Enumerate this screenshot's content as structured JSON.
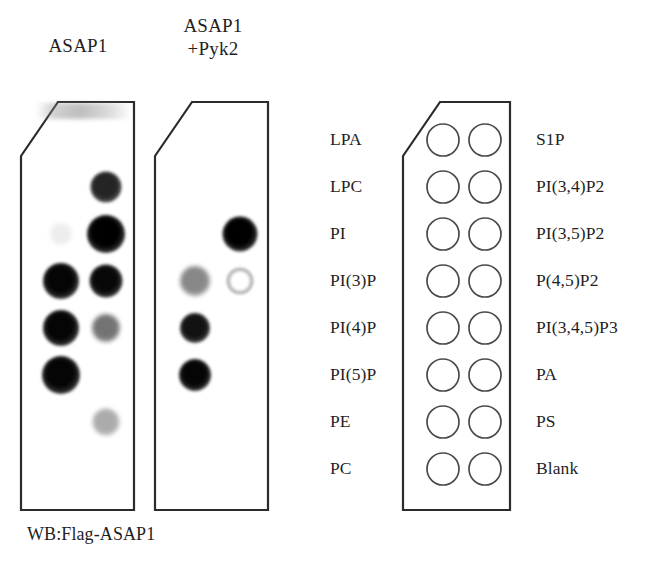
{
  "figure": {
    "caption": "WB:Flag-ASAP1",
    "assay_type": "protein-lipid overlay (lipid strip) assay"
  },
  "blots": [
    {
      "id": "blot-asap1",
      "title": "ASAP1",
      "spots": [
        {
          "row": 2,
          "col": "right",
          "lipid": "PI(3,4)P2",
          "intensity": "strong",
          "diameter": 31,
          "darkness": 0.86
        },
        {
          "row": 3,
          "col": "right",
          "lipid": "PI(3,5)P2",
          "intensity": "very-strong",
          "diameter": 38,
          "darkness": 1.0
        },
        {
          "row": 3,
          "col": "left",
          "lipid": "PI",
          "intensity": "trace",
          "diameter": 22,
          "darkness": 0.07
        },
        {
          "row": 4,
          "col": "left",
          "lipid": "PI(3)P",
          "intensity": "very-strong",
          "diameter": 36,
          "darkness": 0.98
        },
        {
          "row": 4,
          "col": "right",
          "lipid": "P(4,5)P2",
          "intensity": "very-strong",
          "diameter": 33,
          "darkness": 0.97
        },
        {
          "row": 5,
          "col": "left",
          "lipid": "PI(4)P",
          "intensity": "very-strong",
          "diameter": 36,
          "darkness": 0.98
        },
        {
          "row": 5,
          "col": "right",
          "lipid": "PI(3,4,5)P3",
          "intensity": "moderate",
          "diameter": 28,
          "darkness": 0.55
        },
        {
          "row": 6,
          "col": "left",
          "lipid": "PI(5)P",
          "intensity": "very-strong",
          "diameter": 38,
          "darkness": 0.98
        },
        {
          "row": 7,
          "col": "right",
          "lipid": "PS",
          "intensity": "weak",
          "diameter": 27,
          "darkness": 0.33
        }
      ]
    },
    {
      "id": "blot-asap1-pyk2",
      "title": "ASAP1\n+Pyk2",
      "spots": [
        {
          "row": 3,
          "col": "right",
          "lipid": "PI(3,5)P2",
          "intensity": "very-strong",
          "diameter": 35,
          "darkness": 1.0
        },
        {
          "row": 4,
          "col": "left",
          "lipid": "PI(3)P",
          "intensity": "moderate",
          "diameter": 30,
          "darkness": 0.47
        },
        {
          "row": 4,
          "col": "right",
          "lipid": "P(4,5)P2",
          "intensity": "faint-ring",
          "diameter": 28,
          "darkness": 0.14
        },
        {
          "row": 5,
          "col": "left",
          "lipid": "PI(4)P",
          "intensity": "strong",
          "diameter": 30,
          "darkness": 0.93
        },
        {
          "row": 6,
          "col": "left",
          "lipid": "PI(5)P",
          "intensity": "very-strong",
          "diameter": 32,
          "darkness": 0.98
        }
      ]
    }
  ],
  "schematic": {
    "name": "lipid-strip-key",
    "rows": 8,
    "columns": 2,
    "spot_count": 16,
    "left_labels": [
      "LPA",
      "LPC",
      "PI",
      "PI(3)P",
      "PI(4)P",
      "PI(5)P",
      "PE",
      "PC"
    ],
    "right_labels": [
      "S1P",
      "PI(3,4)P2",
      "PI(3,5)P2",
      "P(4,5)P2",
      "PI(3,4,5)P3",
      "PA",
      "PS",
      "Blank"
    ]
  },
  "colors": {
    "ink": "#1f1f1f",
    "outline": "#2b2b2b",
    "circle_stroke": "#4a4a4a",
    "background": "#ffffff"
  }
}
